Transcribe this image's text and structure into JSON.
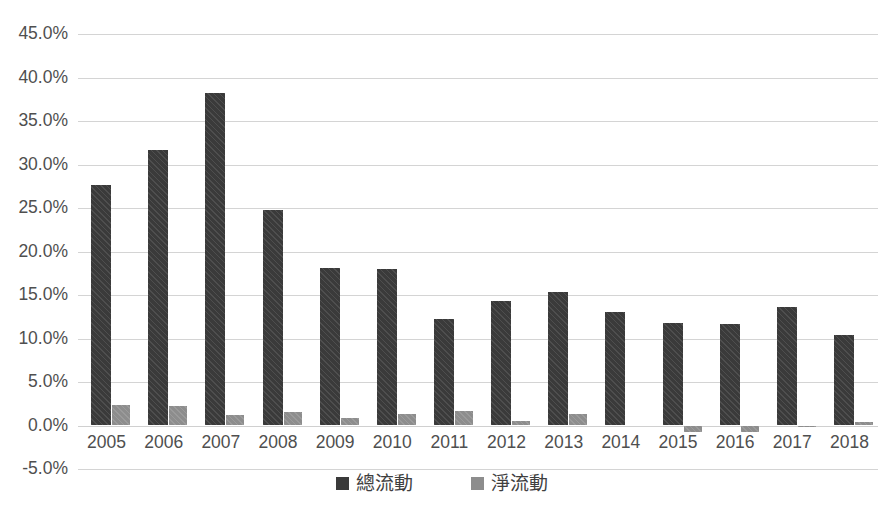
{
  "chart_data": {
    "type": "bar",
    "title": "",
    "subtitle": "",
    "xlabel": "",
    "ylabel": "",
    "categories": [
      "2005",
      "2006",
      "2007",
      "2008",
      "2009",
      "2010",
      "2011",
      "2012",
      "2013",
      "2014",
      "2015",
      "2016",
      "2017",
      "2018"
    ],
    "series": [
      {
        "name": "總流動",
        "color": "#3a3a3a",
        "values": [
          27.6,
          31.7,
          38.2,
          24.8,
          18.1,
          18.0,
          12.2,
          14.3,
          15.3,
          13.0,
          11.8,
          11.7,
          13.6,
          10.4
        ]
      },
      {
        "name": "淨流動",
        "color": "#8d8d8d",
        "values": [
          2.3,
          2.2,
          1.2,
          1.6,
          0.9,
          1.3,
          1.7,
          0.5,
          1.3,
          0.0,
          -0.8,
          -0.8,
          -0.1,
          0.4
        ]
      }
    ],
    "ylim": [
      -5.0,
      45.0
    ],
    "ytick_values": [
      45.0,
      40.0,
      35.0,
      30.0,
      25.0,
      20.0,
      15.0,
      10.0,
      5.0,
      0.0,
      -5.0
    ],
    "ytick_labels": [
      "45.0%",
      "40.0%",
      "35.0%",
      "30.0%",
      "25.0%",
      "20.0%",
      "15.0%",
      "10.0%",
      "5.0%",
      "0.0%",
      "-5.0%"
    ],
    "grid": true,
    "grid_color": "#d4d4d4",
    "legend_position": "bottom",
    "units": "percent",
    "background": "#ffffff"
  },
  "legend": {
    "items": [
      {
        "label": "總流動",
        "swatch": "total"
      },
      {
        "label": "淨流動",
        "swatch": "net"
      }
    ]
  }
}
